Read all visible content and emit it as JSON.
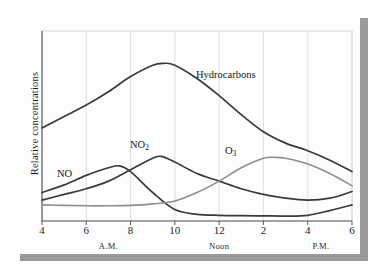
{
  "chart_data": {
    "type": "line",
    "title": "",
    "subtitle": "",
    "xlabel": "",
    "ylabel": "Relative concentrations",
    "grid": "vertical",
    "legend_position": "inline-labels",
    "x_tick_labels": [
      "4",
      "6",
      "8",
      "10",
      "12",
      "2",
      "4",
      "6"
    ],
    "x_tick_hours": [
      4,
      6,
      8,
      10,
      12,
      14,
      16,
      18
    ],
    "x_period_labels": [
      {
        "text": "A.M.",
        "hour": 7
      },
      {
        "text": "Noon",
        "hour": 12
      },
      {
        "text": "P.M.",
        "hour": 16.6
      }
    ],
    "xlim": [
      4,
      18
    ],
    "ylim": [
      0,
      1
    ],
    "y_axis_ticks_shown": false,
    "series": [
      {
        "name": "Hydrocarbons",
        "color": "#3a3a3a",
        "width": 1.7,
        "x": [
          4,
          5,
          6,
          7,
          8,
          9,
          9.5,
          10,
          11,
          12,
          13,
          14,
          15,
          16,
          17,
          18
        ],
        "values": [
          0.49,
          0.55,
          0.61,
          0.68,
          0.76,
          0.82,
          0.83,
          0.82,
          0.75,
          0.66,
          0.56,
          0.47,
          0.41,
          0.37,
          0.32,
          0.26
        ]
      },
      {
        "name": "NO",
        "color": "#3a3a3a",
        "width": 1.7,
        "x": [
          4,
          5,
          6,
          7,
          7.5,
          8,
          9,
          10,
          11,
          12,
          13,
          14,
          15,
          16,
          17,
          18
        ],
        "values": [
          0.15,
          0.19,
          0.24,
          0.28,
          0.29,
          0.26,
          0.15,
          0.06,
          0.035,
          0.03,
          0.028,
          0.027,
          0.026,
          0.03,
          0.055,
          0.085
        ]
      },
      {
        "name": "NO2",
        "display_name": "NO₂",
        "color": "#3a3a3a",
        "width": 1.7,
        "x": [
          4,
          5,
          6,
          7,
          8,
          9,
          9.4,
          10,
          11,
          12,
          13,
          14,
          15,
          16,
          17,
          18
        ],
        "values": [
          0.11,
          0.14,
          0.17,
          0.21,
          0.27,
          0.33,
          0.34,
          0.31,
          0.25,
          0.21,
          0.17,
          0.14,
          0.12,
          0.11,
          0.12,
          0.155
        ]
      },
      {
        "name": "O3",
        "display_name": "O₃",
        "color": "#8e8e8e",
        "width": 1.6,
        "x": [
          4,
          5,
          6,
          7,
          8,
          9,
          10,
          11,
          12,
          13,
          14,
          14.5,
          15,
          16,
          17,
          18
        ],
        "values": [
          0.085,
          0.082,
          0.08,
          0.08,
          0.082,
          0.09,
          0.105,
          0.15,
          0.21,
          0.28,
          0.33,
          0.335,
          0.33,
          0.3,
          0.25,
          0.185
        ]
      }
    ],
    "annotations": [
      {
        "text": "Hydrocarbons",
        "series": "Hydrocarbons"
      },
      {
        "text": "NO",
        "series": "NO"
      },
      {
        "text": "NO₂",
        "series": "NO2"
      },
      {
        "text": "O₃",
        "series": "O3"
      }
    ],
    "colors": {
      "dark_curve": "#3a3a3a",
      "light_curve": "#8e8e8e",
      "grid": "#d8d8d8",
      "axis": "#5a5a5a",
      "shadow": "#9a9a9a",
      "background": "#fdfdfd"
    }
  }
}
